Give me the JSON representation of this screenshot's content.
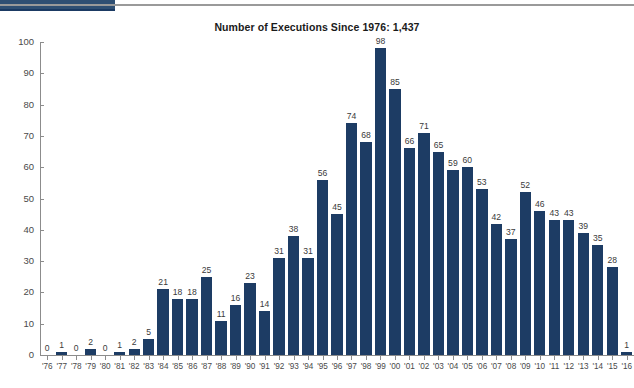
{
  "top_strip": {
    "tab_name": "active-tab",
    "tab_color": "#2f4f73",
    "rule_color": "#9a9a9a"
  },
  "chart_data": {
    "type": "bar",
    "title": "Number of Executions Since 1976: 1,437",
    "xlabel": "",
    "ylabel": "",
    "ylim": [
      0,
      100
    ],
    "ytick_step": 10,
    "grid": false,
    "legend": "none",
    "bar_color": "#1d3c64",
    "axis_color": "#8c8c8c",
    "yticks": [
      "0",
      "10",
      "20",
      "30",
      "40",
      "50",
      "60",
      "70",
      "80",
      "90",
      "100"
    ],
    "categories": [
      "'76",
      "'77",
      "'78",
      "'79",
      "'80",
      "'81",
      "'82",
      "'83",
      "'84",
      "'85",
      "'86",
      "'87",
      "'88",
      "'89",
      "'90",
      "'91",
      "'92",
      "'93",
      "'94",
      "'95",
      "'96",
      "'97",
      "'98",
      "'99",
      "'00",
      "'01",
      "'02",
      "'03",
      "'04",
      "'05",
      "'06",
      "'07",
      "'08",
      "'09",
      "'10",
      "'11",
      "'12",
      "'13",
      "'14",
      "'15",
      "'16"
    ],
    "values": [
      0,
      1,
      0,
      2,
      0,
      1,
      2,
      5,
      21,
      18,
      18,
      25,
      11,
      16,
      23,
      14,
      31,
      38,
      31,
      56,
      45,
      74,
      68,
      98,
      85,
      66,
      71,
      65,
      59,
      60,
      53,
      42,
      37,
      52,
      46,
      43,
      43,
      39,
      35,
      28,
      1
    ],
    "total_label": "1,437",
    "value_labels": [
      "0",
      "1",
      "0",
      "2",
      "0",
      "1",
      "2",
      "5",
      "21",
      "18",
      "18",
      "25",
      "11",
      "16",
      "23",
      "14",
      "31",
      "38",
      "31",
      "56",
      "45",
      "74",
      "68",
      "98",
      "85",
      "66",
      "71",
      "65",
      "59",
      "60",
      "53",
      "42",
      "37",
      "52",
      "46",
      "43",
      "43",
      "39",
      "35",
      "28",
      "1"
    ]
  }
}
